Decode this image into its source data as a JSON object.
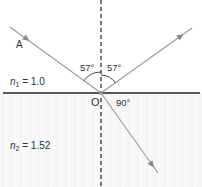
{
  "diagram": {
    "type": "reflection-refraction",
    "point_label": "O",
    "ray_label": "A",
    "medium_1": {
      "symbol": "n",
      "subscript": "1",
      "equals": "= 1.0",
      "index": 1.0
    },
    "medium_2": {
      "symbol": "n",
      "subscript": "2",
      "equals": "= 1.52",
      "index": 1.52
    },
    "angles": {
      "incident": "57°",
      "reflected": "57°",
      "between_reflected_and_refracted": "90°"
    },
    "colors": {
      "ray": "#9a9a9a",
      "interface": "#222222",
      "normal": "#222222",
      "lower_medium": "#f5f5f5"
    }
  }
}
